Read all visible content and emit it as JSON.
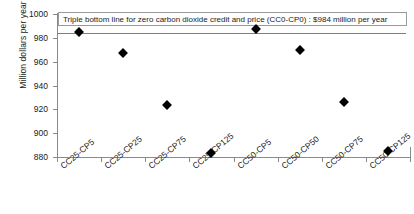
{
  "chart_data": {
    "type": "scatter",
    "title": "",
    "xlabel": "",
    "ylabel": "Million dollars per year",
    "ylim": [
      880,
      1000
    ],
    "yticks": [
      880,
      900,
      920,
      940,
      960,
      980,
      1000
    ],
    "grid": false,
    "legend": null,
    "categories": [
      "CC25-CP5",
      "CC25-CP25",
      "CC25-CP75",
      "CC25-CP125",
      "CC50-CP5",
      "CC50-CP50",
      "CC50-CP75",
      "CC50-CP125"
    ],
    "values": [
      985,
      967,
      924,
      883,
      987,
      970,
      926,
      885
    ],
    "series": [
      {
        "name": "Triple bottom line",
        "values": [
          985,
          967,
          924,
          883,
          987,
          970,
          926,
          885
        ],
        "marker": "diamond",
        "color": "#000000"
      }
    ],
    "annotations": [
      {
        "name": "reference-line",
        "type": "hline",
        "value": 984,
        "label": "Triple bottom line for zero carbon dioxide credit and price (CC0-CP0) : $984 million per year",
        "color": "#7d7d7d"
      }
    ]
  },
  "axis": {
    "y_title": "Million dollars per year",
    "y_tick_labels": [
      "1000",
      "980",
      "960",
      "940",
      "920",
      "900",
      "880"
    ],
    "x_tick_labels": [
      "CC25-CP5",
      "CC25-CP25",
      "CC25-CP75",
      "CC25-CP125",
      "CC50-CP5",
      "CC50-CP50",
      "CC50-CP75",
      "CC50-CP125"
    ]
  },
  "annotation": {
    "text": "Triple bottom line for zero carbon dioxide credit and price (CC0-CP0) : $984 million per year"
  },
  "colors": {
    "axis": "#8a8a8a",
    "marker": "#000000",
    "reference_line": "#7d7d7d",
    "annotation_border": "#9a9a9a",
    "background": "#ffffff"
  }
}
